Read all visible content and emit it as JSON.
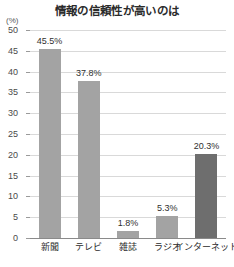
{
  "chart_data": {
    "type": "bar",
    "title": "情報の信頼性が高いのは",
    "xlabel": "",
    "ylabel": "(%)",
    "unit_label": "(%)",
    "categories": [
      "新聞",
      "テレビ",
      "雑誌",
      "ラジオ",
      "インターネット"
    ],
    "values": [
      45.5,
      37.8,
      1.8,
      5.3,
      20.3
    ],
    "value_labels": [
      "45.5%",
      "37.8%",
      "1.8%",
      "5.3%",
      "20.3%"
    ],
    "ylim": [
      0,
      50
    ],
    "yticks": [
      50,
      45,
      40,
      35,
      30,
      25,
      20,
      15,
      10,
      5,
      0
    ],
    "ytick_labels": [
      "50",
      "45",
      "40",
      "35",
      "30",
      "25",
      "20",
      "15",
      "10",
      "5",
      "0"
    ],
    "grid": true,
    "legend": null,
    "series": [
      {
        "name": "信頼性が高いと答えた割合",
        "values": [
          45.5,
          37.8,
          1.8,
          5.3,
          20.3
        ]
      }
    ],
    "colors": {
      "bar_default": "#a3a3a3",
      "bar_highlight": "#6e6e6e",
      "gridline": "#d9d9d9",
      "axis": "#8a8a8a",
      "text": "#2b2b2b",
      "background": "#ffffff"
    },
    "bar_color_map": [
      "default",
      "default",
      "default",
      "default",
      "highlight"
    ]
  }
}
